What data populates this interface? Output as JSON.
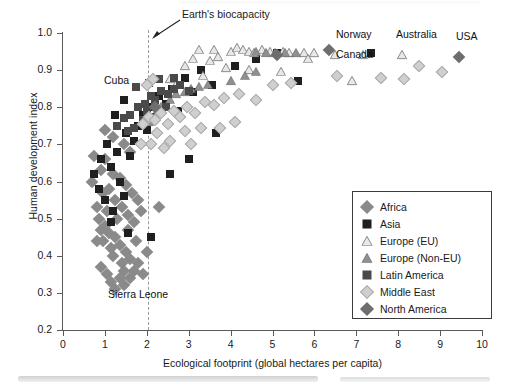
{
  "chart_data": {
    "type": "scatter",
    "title": "",
    "xlabel": "Ecological footprint (global hectares per capita)",
    "ylabel": "Human development index",
    "xlim": [
      0,
      10
    ],
    "ylim": [
      0.2,
      1.0
    ],
    "xticks": [
      "0",
      "1",
      "2",
      "3",
      "4",
      "5",
      "6",
      "7",
      "8",
      "9",
      "10"
    ],
    "yticks": [
      "0.2",
      "0.3",
      "0.4",
      "0.5",
      "0.6",
      "0.7",
      "0.8",
      "0.9",
      "1.0"
    ],
    "grid": false,
    "legend_position": "bottom-right",
    "reference_lines": [
      {
        "name": "Earth's biocapacity",
        "axis": "x",
        "value": 2.05,
        "style": "dashed"
      }
    ],
    "annotations": [
      {
        "label": "Earth's biocapacity",
        "x": 2.05,
        "y": 1.02
      },
      {
        "label": "Cuba",
        "x": 1.75,
        "y": 0.855
      },
      {
        "label": "Sierra Leone",
        "x": 1.5,
        "y": 0.283
      },
      {
        "label": "Norway",
        "x": 6.3,
        "y": 0.975
      },
      {
        "label": "Canada",
        "x": 6.35,
        "y": 0.935
      },
      {
        "label": "Australia",
        "x": 7.85,
        "y": 0.975
      },
      {
        "label": "USA",
        "x": 9.45,
        "y": 0.975
      }
    ],
    "series": [
      {
        "name": "Africa",
        "marker": "diamond",
        "color": "#8a8a8a",
        "points": [
          [
            0.7,
            0.6
          ],
          [
            0.8,
            0.53
          ],
          [
            0.85,
            0.5
          ],
          [
            0.9,
            0.47
          ],
          [
            0.95,
            0.44
          ],
          [
            1.0,
            0.48
          ],
          [
            1.05,
            0.52
          ],
          [
            1.1,
            0.46
          ],
          [
            1.15,
            0.42
          ],
          [
            1.2,
            0.4
          ],
          [
            1.25,
            0.45
          ],
          [
            1.3,
            0.5
          ],
          [
            1.35,
            0.43
          ],
          [
            1.4,
            0.38
          ],
          [
            1.45,
            0.36
          ],
          [
            1.5,
            0.41
          ],
          [
            1.55,
            0.47
          ],
          [
            1.6,
            0.39
          ],
          [
            1.05,
            0.35
          ],
          [
            1.15,
            0.33
          ],
          [
            1.25,
            0.31
          ],
          [
            1.35,
            0.34
          ],
          [
            1.45,
            0.32
          ],
          [
            1.6,
            0.34
          ],
          [
            1.7,
            0.36
          ],
          [
            1.8,
            0.38
          ],
          [
            1.9,
            0.35
          ],
          [
            0.95,
            0.57
          ],
          [
            1.1,
            0.58
          ],
          [
            1.25,
            0.55
          ],
          [
            1.4,
            0.53
          ],
          [
            1.55,
            0.51
          ],
          [
            1.7,
            0.49
          ],
          [
            1.85,
            0.52
          ],
          [
            2.0,
            0.41
          ],
          [
            2.3,
            0.53
          ],
          [
            0.75,
            0.67
          ],
          [
            0.9,
            0.63
          ],
          [
            1.0,
            0.66
          ],
          [
            1.2,
            0.62
          ],
          [
            1.35,
            0.61
          ],
          [
            1.5,
            0.59
          ],
          [
            1.65,
            0.57
          ],
          [
            1.8,
            0.55
          ],
          [
            1.0,
            0.74
          ],
          [
            1.2,
            0.72
          ],
          [
            1.45,
            0.7
          ],
          [
            1.6,
            0.68
          ],
          [
            0.8,
            0.44
          ],
          [
            0.9,
            0.37
          ],
          [
            1.75,
            0.44
          ]
        ]
      },
      {
        "name": "Asia",
        "marker": "square",
        "color": "#1f1f1f",
        "points": [
          [
            0.75,
            0.62
          ],
          [
            0.85,
            0.58
          ],
          [
            0.9,
            0.66
          ],
          [
            1.0,
            0.55
          ],
          [
            1.05,
            0.7
          ],
          [
            1.15,
            0.64
          ],
          [
            1.2,
            0.52
          ],
          [
            1.3,
            0.68
          ],
          [
            1.35,
            0.6
          ],
          [
            1.45,
            0.56
          ],
          [
            1.5,
            0.73
          ],
          [
            1.6,
            0.67
          ],
          [
            1.7,
            0.71
          ],
          [
            1.8,
            0.75
          ],
          [
            1.9,
            0.78
          ],
          [
            2.0,
            0.74
          ],
          [
            2.1,
            0.8
          ],
          [
            2.2,
            0.77
          ],
          [
            2.3,
            0.83
          ],
          [
            2.45,
            0.81
          ],
          [
            2.6,
            0.85
          ],
          [
            2.75,
            0.79
          ],
          [
            2.9,
            0.88
          ],
          [
            3.1,
            0.84
          ],
          [
            3.3,
            0.9
          ],
          [
            3.55,
            0.86
          ],
          [
            4.1,
            0.91
          ],
          [
            4.6,
            0.93
          ],
          [
            5.1,
            0.945
          ],
          [
            5.6,
            0.87
          ],
          [
            1.55,
            0.46
          ],
          [
            2.1,
            0.45
          ],
          [
            2.55,
            0.62
          ],
          [
            3.0,
            0.66
          ],
          [
            3.65,
            0.73
          ],
          [
            7.35,
            0.945
          ],
          [
            1.25,
            0.78
          ],
          [
            1.45,
            0.82
          ],
          [
            1.15,
            0.49
          ]
        ]
      },
      {
        "name": "Europe (EU)",
        "marker": "triangle-open",
        "color": "#dcdcdc",
        "points": [
          [
            3.25,
            0.955
          ],
          [
            3.6,
            0.955
          ],
          [
            3.7,
            0.935
          ],
          [
            4.0,
            0.95
          ],
          [
            4.15,
            0.96
          ],
          [
            4.3,
            0.955
          ],
          [
            4.45,
            0.95
          ],
          [
            4.55,
            0.945
          ],
          [
            4.75,
            0.955
          ],
          [
            4.95,
            0.95
          ],
          [
            5.25,
            0.95
          ],
          [
            5.4,
            0.945
          ],
          [
            5.75,
            0.945
          ],
          [
            6.0,
            0.945
          ],
          [
            6.5,
            0.94
          ],
          [
            7.15,
            0.94
          ],
          [
            8.1,
            0.94
          ],
          [
            3.5,
            0.925
          ],
          [
            3.9,
            0.905
          ],
          [
            4.45,
            0.9
          ],
          [
            5.2,
            0.895
          ],
          [
            3.35,
            0.885
          ],
          [
            2.9,
            0.91
          ],
          [
            3.1,
            0.93
          ],
          [
            2.55,
            0.875
          ],
          [
            2.7,
            0.86
          ],
          [
            6.9,
            0.87
          ],
          [
            5.85,
            0.93
          ]
        ]
      },
      {
        "name": "Europe (Non-EU)",
        "marker": "triangle-filled",
        "color": "#8f8f8f",
        "points": [
          [
            2.35,
            0.8
          ],
          [
            2.55,
            0.82
          ],
          [
            2.7,
            0.835
          ],
          [
            2.9,
            0.84
          ],
          [
            3.05,
            0.85
          ],
          [
            3.25,
            0.855
          ],
          [
            3.45,
            0.86
          ],
          [
            4.0,
            0.87
          ],
          [
            4.35,
            0.885
          ],
          [
            4.6,
            0.895
          ],
          [
            5.05,
            0.945
          ],
          [
            5.3,
            0.945
          ],
          [
            5.55,
            0.945
          ],
          [
            4.85,
            0.945
          ],
          [
            4.6,
            0.95
          ],
          [
            2.2,
            0.78
          ],
          [
            2.05,
            0.76
          ]
        ]
      },
      {
        "name": "Latin America",
        "marker": "square",
        "color": "#4a4a4a",
        "points": [
          [
            1.3,
            0.75
          ],
          [
            1.45,
            0.77
          ],
          [
            1.6,
            0.78
          ],
          [
            1.75,
            0.855
          ],
          [
            1.8,
            0.8
          ],
          [
            1.95,
            0.81
          ],
          [
            2.0,
            0.79
          ],
          [
            2.1,
            0.83
          ],
          [
            2.2,
            0.82
          ],
          [
            2.35,
            0.845
          ],
          [
            2.5,
            0.835
          ],
          [
            2.65,
            0.85
          ],
          [
            2.8,
            0.86
          ],
          [
            3.0,
            0.845
          ],
          [
            2.45,
            0.8
          ],
          [
            2.15,
            0.775
          ],
          [
            1.9,
            0.765
          ],
          [
            1.7,
            0.745
          ],
          [
            2.05,
            0.865
          ],
          [
            2.3,
            0.875
          ],
          [
            2.65,
            0.88
          ],
          [
            1.55,
            0.735
          ]
        ]
      },
      {
        "name": "Middle East",
        "marker": "diamond-light",
        "color": "#cfcfcf",
        "points": [
          [
            1.9,
            0.755
          ],
          [
            2.05,
            0.775
          ],
          [
            2.2,
            0.765
          ],
          [
            2.35,
            0.785
          ],
          [
            2.5,
            0.755
          ],
          [
            2.65,
            0.79
          ],
          [
            2.8,
            0.775
          ],
          [
            2.95,
            0.8
          ],
          [
            3.15,
            0.785
          ],
          [
            3.4,
            0.815
          ],
          [
            3.6,
            0.805
          ],
          [
            3.85,
            0.825
          ],
          [
            4.2,
            0.835
          ],
          [
            4.6,
            0.82
          ],
          [
            2.25,
            0.73
          ],
          [
            2.55,
            0.71
          ],
          [
            2.9,
            0.735
          ],
          [
            3.3,
            0.745
          ],
          [
            2.1,
            0.7
          ],
          [
            2.4,
            0.69
          ],
          [
            3.75,
            0.745
          ],
          [
            4.1,
            0.76
          ],
          [
            5.0,
            0.86
          ],
          [
            5.45,
            0.865
          ],
          [
            8.5,
            0.91
          ],
          [
            9.05,
            0.895
          ],
          [
            8.15,
            0.875
          ],
          [
            7.6,
            0.88
          ],
          [
            6.55,
            0.885
          ],
          [
            2.0,
            0.86
          ],
          [
            2.15,
            0.875
          ],
          [
            1.85,
            0.7
          ],
          [
            3.05,
            0.7
          ]
        ]
      },
      {
        "name": "North America",
        "marker": "diamond-dark",
        "color": "#6e6e6e",
        "points": [
          [
            9.45,
            0.935
          ],
          [
            6.35,
            0.955
          ],
          [
            5.1,
            0.94
          ],
          [
            2.2,
            0.8
          ]
        ]
      }
    ]
  },
  "axes": {
    "y_title": "Human development index",
    "x_title": "Ecological footprint (global hectares per capita)",
    "y_tick_labels": [
      "1.0",
      "0.9",
      "0.8",
      "0.7",
      "0.6",
      "0.5",
      "0.4",
      "0.3",
      "0.2"
    ],
    "x_tick_labels": [
      "0",
      "1",
      "2",
      "3",
      "4",
      "5",
      "6",
      "7",
      "8",
      "9",
      "10"
    ]
  },
  "legend": {
    "items": [
      {
        "label": "Africa",
        "glyph": "diamond-medium-gray",
        "color": "#8a8a8a"
      },
      {
        "label": "Asia",
        "glyph": "square-black",
        "color": "#1f1f1f"
      },
      {
        "label": "Europe (EU)",
        "glyph": "triangle-open",
        "color": "#dcdcdc"
      },
      {
        "label": "Europe (Non-EU)",
        "glyph": "triangle-gray",
        "color": "#8f8f8f"
      },
      {
        "label": "Latin America",
        "glyph": "square-dark-gray",
        "color": "#4a4a4a"
      },
      {
        "label": "Middle East",
        "glyph": "diamond-light-gray",
        "color": "#cfcfcf"
      },
      {
        "label": "North America",
        "glyph": "diamond-dark-gray",
        "color": "#6e6e6e"
      }
    ]
  },
  "annotations": {
    "biocapacity": "Earth's biocapacity",
    "cuba": "Cuba",
    "sierra_leone": "Sierra Leone",
    "norway": "Norway",
    "canada": "Canada",
    "australia": "Australia",
    "usa": "USA"
  }
}
